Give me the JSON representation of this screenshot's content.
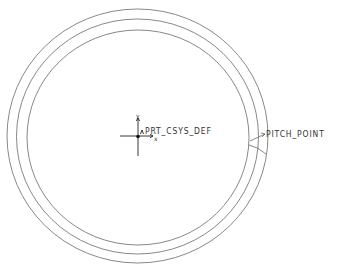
{
  "drawing": {
    "type": "gear blank sketch (concentric circles)",
    "line_color": "#6a6a6a",
    "background": "#ffffff",
    "circles": [
      {
        "name": "outer-circle",
        "cx": 137.5,
        "cy": 136,
        "rx": 130.5,
        "ry": 127
      },
      {
        "name": "middle-circle",
        "cx": 137.5,
        "cy": 136.5,
        "rx": 121,
        "ry": 117.5
      },
      {
        "name": "inner-circle",
        "cx": 138,
        "cy": 137.5,
        "rx": 111,
        "ry": 107.5
      }
    ]
  },
  "labels": {
    "csys": "PRT_CSYS_DEF",
    "csys_display": "PRT_CSYS_DEF",
    "pitch_point": "PITCH_POINT",
    "axis_x": "x",
    "axis_y": "y"
  }
}
